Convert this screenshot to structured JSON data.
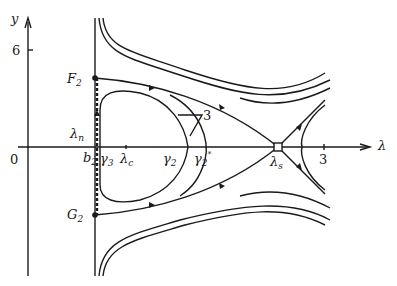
{
  "diagram": {
    "type": "phase-portrait",
    "axes": {
      "x_label": "λ",
      "y_label": "y",
      "origin_label": "0",
      "y_tick": "6",
      "x_tick": "3"
    },
    "points": {
      "F": {
        "base": "F",
        "sub": "2"
      },
      "G": {
        "base": "G",
        "sub": "2"
      },
      "lambda_n": {
        "base": "λ",
        "sub": "n"
      },
      "b": {
        "base": "b",
        "sub": "2"
      },
      "gamma3": {
        "base": "γ",
        "sub": "3"
      },
      "lambda_c": {
        "base": "λ",
        "sub": "c"
      },
      "gamma2": {
        "base": "γ",
        "sub": "2"
      },
      "gamma2_star": {
        "base": "γ",
        "sub": "2",
        "sup": "*"
      },
      "lambda_s": {
        "base": "λ",
        "sub": "s"
      }
    },
    "annotation": "3",
    "colors": {
      "ink": "#1a1a1a",
      "background": "#ffffff"
    }
  }
}
